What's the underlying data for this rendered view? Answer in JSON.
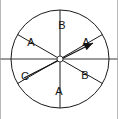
{
  "figure": {
    "width": 118,
    "height": 119,
    "background_color": "#ffffff"
  },
  "chart_data": {
    "type": "pie",
    "categories": [
      "B",
      "A",
      "B",
      "A",
      "C",
      "A"
    ],
    "values": [
      1,
      1,
      1,
      1,
      1,
      1
    ],
    "sector_angle_degrees": 60,
    "legend": "none",
    "grid": false,
    "sectors": [
      {
        "index": 0,
        "label": "B",
        "start_angle_deg": -90,
        "end_angle_deg": -30,
        "center_angle_deg": -60,
        "label_x": 62,
        "label_y": 26
      },
      {
        "index": 1,
        "label": "A",
        "start_angle_deg": -30,
        "end_angle_deg": 30,
        "center_angle_deg": 0,
        "label_x": 86,
        "label_y": 43
      },
      {
        "index": 2,
        "label": "B",
        "start_angle_deg": 30,
        "end_angle_deg": 90,
        "center_angle_deg": 60,
        "label_x": 85,
        "label_y": 76
      },
      {
        "index": 3,
        "label": "A",
        "start_angle_deg": 90,
        "end_angle_deg": 150,
        "center_angle_deg": 120,
        "label_x": 59,
        "label_y": 92
      },
      {
        "index": 4,
        "label": "C",
        "start_angle_deg": 150,
        "end_angle_deg": 210,
        "center_angle_deg": 180,
        "label_x": 25,
        "label_y": 77
      },
      {
        "index": 5,
        "label": "A",
        "start_angle_deg": 210,
        "end_angle_deg": 270,
        "center_angle_deg": 240,
        "label_x": 31,
        "label_y": 43
      }
    ]
  },
  "wheel": {
    "center_x": 60,
    "center_y": 59,
    "radius": 49,
    "outline_color": "#1a1a1a",
    "outline_width": 1,
    "divider_color": "#1a1a1a",
    "divider_width": 1,
    "fill_color": "#ffffff"
  },
  "pointer": {
    "name": "spinner-needle",
    "points_to_sector_label": "A",
    "angle_deg": -27,
    "color": "#111111",
    "tail_x": 24,
    "tail_y": 78,
    "tip_x": 93,
    "tip_y": 43,
    "hub_radius": 3,
    "hub_color": "#ffffff"
  },
  "guide_line": {
    "name": "horizontal-guide-line",
    "color": "#9a9a9a",
    "width": 2,
    "y": 59,
    "x_start": 0,
    "x_end": 118
  },
  "frame": {
    "edge_color": "#b8b8b8",
    "edge_width": 1
  }
}
